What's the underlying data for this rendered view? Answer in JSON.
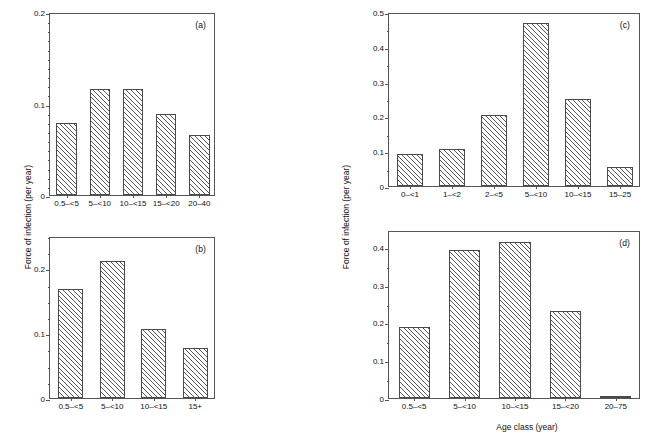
{
  "figure": {
    "y_axis_title_left": "Force of infection (per year)",
    "y_axis_title_right": "Force of infection (per year)",
    "x_axis_title": "Age class (year)"
  },
  "chart_data": [
    {
      "type": "bar",
      "panel": "(a)",
      "title": "",
      "xlabel": "",
      "ylabel": "Force of infection (per year)",
      "categories": [
        "0.5–<5",
        "5–<10",
        "10–<15",
        "15–<20",
        "20–40"
      ],
      "values": [
        0.079,
        0.116,
        0.116,
        0.089,
        0.066
      ],
      "ylim": [
        0,
        0.2
      ],
      "ytick_major": [
        0,
        0.1,
        0.2
      ],
      "ytick_major_labels": [
        "0",
        "0.1",
        "0.2"
      ],
      "ytick_minor_step": 0.01,
      "grid": false,
      "legend": "none"
    },
    {
      "type": "bar",
      "panel": "(b)",
      "title": "",
      "xlabel": "",
      "ylabel": "Force of infection (per year)",
      "categories": [
        "0.5–<5",
        "5–<10",
        "10–<15",
        "15+"
      ],
      "values": [
        0.168,
        0.211,
        0.107,
        0.077
      ],
      "ylim": [
        0,
        0.25
      ],
      "ytick_major": [
        0,
        0.1,
        0.2
      ],
      "ytick_major_labels": [
        "0",
        "0.1",
        "0.2"
      ],
      "ytick_minor_step": 0.025,
      "grid": false,
      "legend": "none"
    },
    {
      "type": "bar",
      "panel": "(c)",
      "title": "",
      "xlabel": "",
      "ylabel": "Force of infection (per year)",
      "categories": [
        "0–<1",
        "1–<2",
        "2–<5",
        "5–<10",
        "10–<15",
        "15–25"
      ],
      "values": [
        0.092,
        0.105,
        0.205,
        0.468,
        0.25,
        0.056
      ],
      "ylim": [
        0,
        0.5
      ],
      "ytick_major": [
        0,
        0.1,
        0.2,
        0.3,
        0.4,
        0.5
      ],
      "ytick_major_labels": [
        "0",
        "0.1",
        "0.2",
        "0.3",
        "0.4",
        "0.5"
      ],
      "ytick_minor_step": 0.05,
      "grid": false,
      "legend": "none"
    },
    {
      "type": "bar",
      "panel": "(d)",
      "title": "",
      "xlabel": "Age class (year)",
      "ylabel": "Force of infection (per year)",
      "categories": [
        "0.5–<5",
        "5–<10",
        "10–<15",
        "15–<20",
        "20–75"
      ],
      "values": [
        0.188,
        0.393,
        0.414,
        0.231,
        0.005
      ],
      "ylim": [
        0,
        0.445
      ],
      "ytick_major": [
        0,
        0.1,
        0.2,
        0.3,
        0.4
      ],
      "ytick_major_labels": [
        "0",
        "0.1",
        "0.2",
        "0.3",
        "0.4"
      ],
      "ytick_minor_step": 0.05,
      "grid": false,
      "legend": "none"
    }
  ]
}
